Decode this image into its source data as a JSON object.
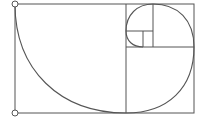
{
  "diagram": {
    "colors": {
      "stroke": "#555555",
      "background": "#ffffff"
    },
    "outer_rect": {
      "x": 15,
      "y": 4,
      "w": 179,
      "h": 109
    },
    "lines": [
      {
        "name": "divider-main-vertical",
        "x1": 126,
        "y1": 4,
        "x2": 126,
        "y2": 113
      },
      {
        "name": "divider-right-horizontal",
        "x1": 126,
        "y1": 47,
        "x2": 194,
        "y2": 47
      },
      {
        "name": "divider-top-vertical",
        "x1": 153,
        "y1": 4,
        "x2": 153,
        "y2": 47
      },
      {
        "name": "divider-small-horizontal",
        "x1": 126,
        "y1": 31,
        "x2": 153,
        "y2": 31
      },
      {
        "name": "divider-tiny-vertical",
        "x1": 143,
        "y1": 31,
        "x2": 143,
        "y2": 47
      }
    ],
    "spiral_path": "M15,4 C15,70 60,113 126,113 C168,113 194,88 194,47 C194,20 178,4 153,4 C137,4 126,15 126,31 C126,41 133,47 143,47",
    "endpoints": [
      {
        "name": "endpoint-top-left",
        "cx": 15,
        "cy": 4
      },
      {
        "name": "endpoint-bottom-left",
        "cx": 15,
        "cy": 113
      }
    ]
  }
}
